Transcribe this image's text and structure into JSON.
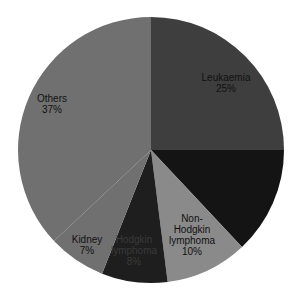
{
  "chart_data": {
    "type": "pie",
    "title": "",
    "start_angle_deg": 0,
    "direction": "clockwise",
    "center": [
      151,
      150
    ],
    "radius": 133,
    "slices": [
      {
        "name": "Leukaemia",
        "value": 25,
        "label": "Leukaemia",
        "pct": "25%",
        "color": "#3e3e3e",
        "labelled": true
      },
      {
        "name": "Unlabelled",
        "value": 13,
        "label": "",
        "pct": "",
        "color": "#141414",
        "labelled": false
      },
      {
        "name": "Non-Hodgkin lymphoma",
        "value": 10,
        "label": "Non-\nHodgkin\nlymphoma",
        "pct": "10%",
        "color": "#8a8a8a",
        "labelled": true
      },
      {
        "name": "Hodgkin lymphoma",
        "value": 8,
        "label": "Hodgkin\nlymphoma",
        "pct": "8%",
        "color": "#1e1e1e",
        "labelled": true
      },
      {
        "name": "Kidney",
        "value": 7,
        "label": "Kidney",
        "pct": "7%",
        "color": "#707070",
        "labelled": true
      },
      {
        "name": "Others",
        "value": 37,
        "label": "Others",
        "pct": "37%",
        "color": "#707070",
        "labelled": true
      }
    ]
  },
  "labels": {
    "leukaemia": {
      "name": "Leukaemia",
      "pct": "25%"
    },
    "nhl": {
      "l1": "Non-",
      "l2": "Hodgkin",
      "l3": "lymphoma",
      "pct": "10%"
    },
    "hodgkin": {
      "l1": "Hodgkin",
      "l2": "lymphoma",
      "pct": "8%"
    },
    "kidney": {
      "name": "Kidney",
      "pct": "7%"
    },
    "others": {
      "name": "Others",
      "pct": "37%"
    }
  }
}
